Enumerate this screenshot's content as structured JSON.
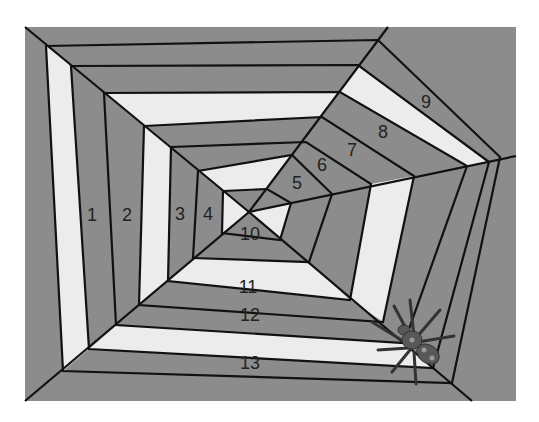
{
  "colors": {
    "background": "#ffffff",
    "web_gray": "#8c8c8c",
    "web_white": "#ececec",
    "line": "#111111",
    "spider_body": "#585858",
    "spider_dark": "#333333",
    "spider_spot": "#9a9a9a"
  },
  "canvas": {
    "x": 25,
    "y": 27,
    "width": 491,
    "height": 374
  },
  "hub": [
    249,
    212
  ],
  "spoke_ends": [
    [
      25,
      27
    ],
    [
      388,
      27
    ],
    [
      516,
      156
    ],
    [
      472,
      401
    ],
    [
      25,
      401
    ]
  ],
  "rings": [
    [
      [
        223,
        191
      ],
      [
        267,
        189
      ],
      [
        291,
        203
      ],
      [
        280,
        240
      ],
      [
        222,
        233
      ]
    ],
    [
      [
        198,
        171
      ],
      [
        292,
        155
      ],
      [
        332,
        194
      ],
      [
        309,
        262
      ],
      [
        193,
        258
      ]
    ],
    [
      [
        171,
        147
      ],
      [
        306,
        142
      ],
      [
        371,
        184
      ],
      [
        350,
        300
      ],
      [
        168,
        281
      ]
    ],
    [
      [
        144,
        126
      ],
      [
        322,
        117
      ],
      [
        414,
        176
      ],
      [
        383,
        322
      ],
      [
        139,
        305
      ]
    ],
    [
      [
        104,
        93
      ],
      [
        340,
        92
      ],
      [
        467,
        166
      ],
      [
        404,
        343
      ],
      [
        116,
        325
      ]
    ],
    [
      [
        71,
        66
      ],
      [
        358,
        65
      ],
      [
        489,
        162
      ],
      [
        433,
        368
      ],
      [
        89,
        349
      ]
    ],
    [
      [
        46,
        46
      ],
      [
        378,
        40
      ],
      [
        500,
        157
      ],
      [
        452,
        383
      ],
      [
        63,
        371
      ]
    ]
  ],
  "fills": {
    "sides": [
      "top",
      "topright",
      "right",
      "bottom",
      "left"
    ],
    "inner": [
      "gray",
      "gray",
      "white",
      "gray",
      "white"
    ],
    "band_1_2": [
      "white",
      "gray",
      "gray",
      "gray",
      "gray"
    ],
    "band_2_3": [
      "gray",
      "gray",
      "gray",
      "white",
      "gray"
    ],
    "band_3_4": [
      "gray",
      "gray",
      "white",
      "gray",
      "white"
    ],
    "band_4_5": [
      "white",
      "gray",
      "gray",
      "gray",
      "gray"
    ],
    "band_5_6": [
      "gray",
      "white",
      "gray",
      "white",
      "gray"
    ],
    "band_6_7": [
      "gray",
      "gray",
      "gray",
      "gray",
      "white"
    ]
  },
  "labels": [
    {
      "text": "1",
      "x": 92,
      "y": 216
    },
    {
      "text": "2",
      "x": 127,
      "y": 216
    },
    {
      "text": "3",
      "x": 180,
      "y": 215
    },
    {
      "text": "4",
      "x": 208,
      "y": 215
    },
    {
      "text": "5",
      "x": 297,
      "y": 184
    },
    {
      "text": "6",
      "x": 322,
      "y": 166
    },
    {
      "text": "7",
      "x": 352,
      "y": 151
    },
    {
      "text": "8",
      "x": 383,
      "y": 133
    },
    {
      "text": "9",
      "x": 426,
      "y": 103
    },
    {
      "text": "10",
      "x": 250,
      "y": 235
    },
    {
      "text": "11",
      "x": 248,
      "y": 288
    },
    {
      "text": "12",
      "x": 250,
      "y": 316
    },
    {
      "text": "13",
      "x": 250,
      "y": 364
    }
  ],
  "spider": {
    "name": "spider",
    "x": 412,
    "y": 340
  }
}
